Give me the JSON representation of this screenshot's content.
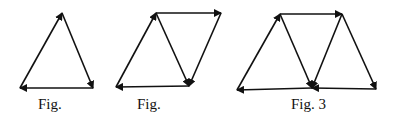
{
  "figures": [
    {
      "caption": "Fig.",
      "vertices": {
        "A": [
          20,
          88
        ],
        "B": [
          62,
          13
        ],
        "C": [
          93,
          88
        ]
      },
      "arrows": [
        [
          "A",
          "B"
        ],
        [
          "B",
          "C"
        ],
        [
          "C",
          "A"
        ]
      ]
    },
    {
      "caption": "Fig.",
      "vertices": {
        "A": [
          116,
          87
        ],
        "B": [
          156,
          13
        ],
        "C": [
          221,
          13
        ],
        "D": [
          189,
          86
        ]
      },
      "arrows": [
        [
          "A",
          "B"
        ],
        [
          "B",
          "C"
        ],
        [
          "B",
          "D"
        ],
        [
          "C",
          "D"
        ],
        [
          "D",
          "A"
        ]
      ]
    },
    {
      "caption": "Fig. 3",
      "vertices": {
        "A": [
          237,
          90
        ],
        "B": [
          280,
          14
        ],
        "C": [
          342,
          14
        ],
        "D": [
          312,
          88
        ],
        "E": [
          376,
          89
        ]
      },
      "arrows": [
        [
          "A",
          "B"
        ],
        [
          "B",
          "C"
        ],
        [
          "B",
          "D"
        ],
        [
          "C",
          "D"
        ],
        [
          "C",
          "E"
        ],
        [
          "E",
          "D"
        ],
        [
          "D",
          "A"
        ]
      ]
    }
  ],
  "colors": {
    "stroke": "#111111",
    "background": "#ffffff"
  }
}
